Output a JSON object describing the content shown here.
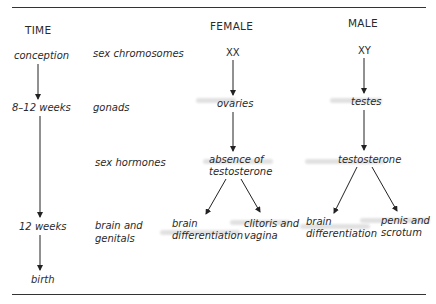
{
  "headers": {
    "time": "TIME",
    "female": "FEMALE",
    "male": "MALE"
  },
  "time_points": [
    "conception",
    "8–12 weeks",
    "12 weeks",
    "birth"
  ],
  "stages": {
    "chromosomes": "sex chromosomes",
    "gonads": "gonads",
    "hormones": "sex hormones",
    "brain_genitals_1": "brain and",
    "brain_genitals_2": "genitals"
  },
  "female": {
    "chromosomes": "XX",
    "gonads": "ovaries",
    "hormones_1": "absence of",
    "hormones_2": "testosterone",
    "brain_1": "brain",
    "brain_2": "differentiation",
    "genitals_1": "clitoris and",
    "genitals_2": "vagina"
  },
  "male": {
    "chromosomes": "XY",
    "gonads": "testes",
    "hormones": "testosterone",
    "brain_1": "brain",
    "brain_2": "differentiation",
    "genitals_1": "penis and",
    "genitals_2": "scrotum"
  }
}
